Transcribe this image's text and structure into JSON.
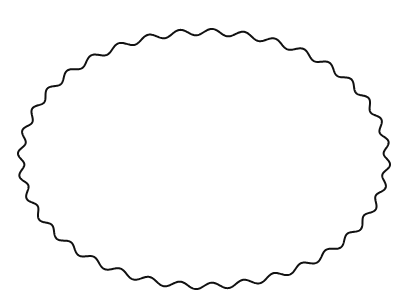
{
  "diagram": {
    "shape": {
      "type": "wavy-ellipse",
      "center": [
        204,
        159
      ],
      "rx": 183,
      "ry": 127,
      "waves": 36,
      "amplitude": 3.2,
      "stroke_color": "#111111",
      "fill_color": "#ffffff",
      "stroke_width": 2
    },
    "background": "#ffffff"
  }
}
